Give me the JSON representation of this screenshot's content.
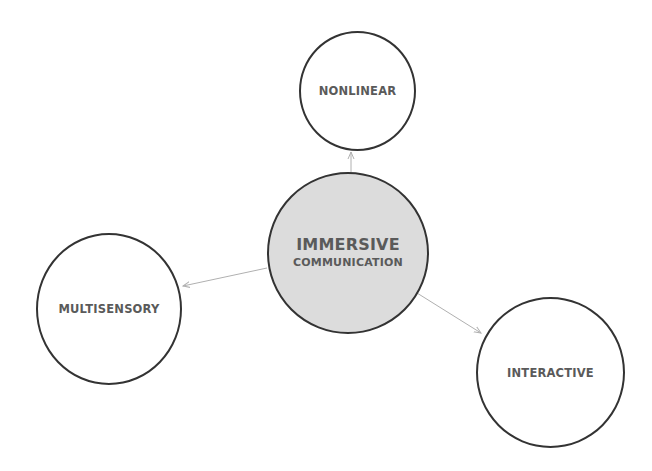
{
  "diagram": {
    "center": {
      "title": "IMMERSIVE",
      "subtitle": "COMMUNICATION",
      "fill": "#dcdcdc"
    },
    "nodes": [
      {
        "label": "NONLINEAR"
      },
      {
        "label": "MULTISENSORY"
      },
      {
        "label": "INTERACTIVE"
      }
    ],
    "colors": {
      "stroke": "#333333",
      "text": "#5a5a5a",
      "arrow": "#b0b0b0"
    }
  }
}
